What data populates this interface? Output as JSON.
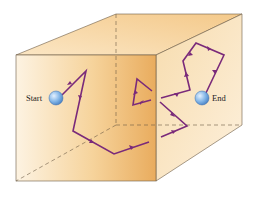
{
  "diagram": {
    "labels": {
      "start": "Start",
      "end": "End"
    },
    "colors": {
      "path": "#7a2a7a",
      "edge": "#6b5a45",
      "ball": "#7fb3e6",
      "face_light": "#fdf1de",
      "face_dark": "#eab265"
    },
    "box": {
      "front_face": [
        [
          16,
          55
        ],
        [
          156,
          55
        ],
        [
          156,
          181
        ],
        [
          16,
          181
        ]
      ],
      "back_top_left": [
        116,
        14
      ],
      "back_top_right": [
        242,
        14
      ],
      "back_bottom_right": [
        242,
        125
      ],
      "hidden_corner": [
        116,
        125
      ]
    },
    "markers": {
      "start": [
        56,
        98
      ],
      "end": [
        202,
        98
      ]
    }
  }
}
